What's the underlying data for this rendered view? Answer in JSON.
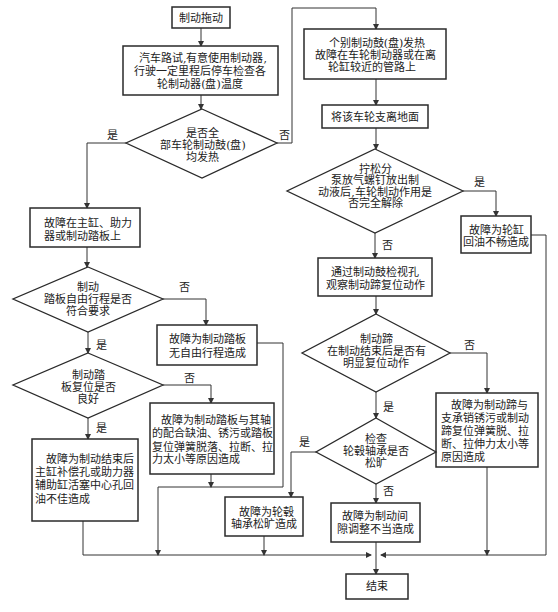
{
  "nodes": {
    "start": {
      "lines": [
        "制动拖动"
      ]
    },
    "road_test": {
      "lines": [
        "汽车路试,有意使用制动器,",
        "行驶一定里程后停车检查各",
        "轮制动器(盘)温度"
      ]
    },
    "all_hot": {
      "lines": [
        "是否全",
        "部车轮制动鼓(盘)",
        "均发热"
      ]
    },
    "master_booster_pedal": {
      "lines": [
        "故障在主缸、助力",
        "器或制动踏板上"
      ]
    },
    "pedal_free_travel": {
      "lines": [
        "制动",
        "踏板自由行程是否",
        "符合要求"
      ]
    },
    "no_free_travel": {
      "lines": [
        "故障为制动踏板",
        "无自由行程造成"
      ]
    },
    "pedal_return": {
      "lines": [
        "制动踏",
        "板复位是否",
        "良好"
      ]
    },
    "pedal_axis_fault": {
      "lines": [
        "故障为制动踏板与其轴",
        "的配合缺油、锈污或踏板",
        "复位弹簧脱落、拉断、拉",
        "力太小等原因造成"
      ]
    },
    "master_return_fault": {
      "lines": [
        "故障为制动结束后",
        "主缸补偿孔或助力器",
        "辅助缸活塞中心孔回",
        "油不佳造成"
      ]
    },
    "individual_hot": {
      "lines": [
        "个别制动鼓(盘)发热",
        "故障在车轮制动器或在离",
        "轮缸较近的管路上"
      ]
    },
    "lift_wheel": {
      "lines": [
        "将该车轮支离地面"
      ]
    },
    "bleed_check": {
      "lines": [
        "拧松分",
        "泵放气螺钉放出制",
        "动液后,车轮制动作用是",
        "否完全解除"
      ]
    },
    "wheel_cylinder_fault": {
      "lines": [
        "故障为轮缸",
        "回油不畅造成"
      ]
    },
    "observe_shoe": {
      "lines": [
        "通过制动鼓检视孔",
        "观察制动蹄复位动作"
      ]
    },
    "shoe_return": {
      "lines": [
        "制动蹄",
        "在制动结束后是否有",
        "明显复位动作"
      ]
    },
    "shoe_fault": {
      "lines": [
        "故障为制动蹄与",
        "支承销锈污或制动",
        "蹄复位弹簧脱、拉",
        "断、拉伸力太小等",
        "原因造成"
      ]
    },
    "bearing_check": {
      "lines": [
        "检查",
        "轮毂轴承是否",
        "松旷"
      ]
    },
    "bearing_fault": {
      "lines": [
        "故障为轮毂",
        "轴承松旷造成"
      ]
    },
    "clearance_fault": {
      "lines": [
        "故障为制动间",
        "隙调整不当造成"
      ]
    },
    "end": {
      "lines": [
        "结束"
      ]
    }
  },
  "labels": {
    "all_hot_yes": "是",
    "all_hot_no": "否",
    "bleed_yes": "是",
    "bleed_no": "否",
    "shoe_return_no": "否",
    "shoe_return_yes": "是",
    "bearing_yes": "是",
    "bearing_no": "否",
    "free_travel_no": "否",
    "free_travel_yes": "是",
    "pedal_return_no": "否",
    "pedal_return_yes": "是"
  },
  "colors": {
    "stroke": "#2a2a2a",
    "background": "#ffffff",
    "text": "#222222"
  }
}
